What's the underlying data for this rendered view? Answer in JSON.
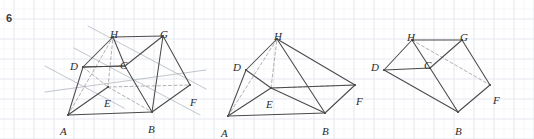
{
  "page": {
    "question_number": "6",
    "background": "#ffffff",
    "grid_color": "#e3e7ef",
    "grid_spacing_px": 20,
    "ink_color": "#4a4a4a",
    "guide_color": "#9aa0a8",
    "dash_color": "#8e8e8e",
    "width": 534,
    "height": 139
  },
  "figures": [
    {
      "id": "figure-1",
      "name": "prism-with-construction-lines",
      "vertices": {
        "A": {
          "x": 68,
          "y": 115
        },
        "B": {
          "x": 152,
          "y": 112
        },
        "C": {
          "x": 125,
          "y": 66
        },
        "D": {
          "x": 83,
          "y": 67
        },
        "E": {
          "x": 108,
          "y": 87
        },
        "F": {
          "x": 190,
          "y": 85
        },
        "G": {
          "x": 163,
          "y": 36
        },
        "H": {
          "x": 113,
          "y": 37
        }
      },
      "labels": [
        {
          "text": "A",
          "x": 60,
          "y": 126
        },
        {
          "text": "B",
          "x": 148,
          "y": 124
        },
        {
          "text": "C",
          "x": 120,
          "y": 60
        },
        {
          "text": "D",
          "x": 70,
          "y": 61
        },
        {
          "text": "E",
          "x": 104,
          "y": 98
        },
        {
          "text": "F",
          "x": 190,
          "y": 97
        },
        {
          "text": "G",
          "x": 160,
          "y": 29
        },
        {
          "text": "H",
          "x": 110,
          "y": 29
        }
      ],
      "solid_edges": [
        [
          "A",
          "B"
        ],
        [
          "A",
          "D"
        ],
        [
          "A",
          "E"
        ],
        [
          "B",
          "C"
        ],
        [
          "B",
          "F"
        ],
        [
          "B",
          "G"
        ],
        [
          "C",
          "D"
        ],
        [
          "C",
          "G"
        ],
        [
          "D",
          "H"
        ],
        [
          "D",
          "C"
        ],
        [
          "F",
          "G"
        ],
        [
          "G",
          "H"
        ],
        [
          "H",
          "C"
        ]
      ],
      "dashed_edges": [
        [
          "A",
          "H"
        ],
        [
          "E",
          "H"
        ],
        [
          "E",
          "F"
        ],
        [
          "D",
          "E"
        ],
        [
          "E",
          "B"
        ]
      ],
      "guide_lines": [
        {
          "x1": 45,
          "y1": 66,
          "x2": 124,
          "y2": 108
        },
        {
          "x1": 74,
          "y1": 48,
          "x2": 200,
          "y2": 115
        },
        {
          "x1": 88,
          "y1": 26,
          "x2": 206,
          "y2": 89
        },
        {
          "x1": 45,
          "y1": 92,
          "x2": 206,
          "y2": 70
        }
      ]
    },
    {
      "id": "figure-2",
      "name": "prism-clean-view",
      "vertices": {
        "A": {
          "x": 228,
          "y": 116
        },
        "B": {
          "x": 325,
          "y": 113
        },
        "D": {
          "x": 246,
          "y": 70
        },
        "E": {
          "x": 271,
          "y": 88
        },
        "F": {
          "x": 355,
          "y": 85
        },
        "H": {
          "x": 277,
          "y": 39
        }
      },
      "labels": [
        {
          "text": "A",
          "x": 221,
          "y": 128
        },
        {
          "text": "B",
          "x": 322,
          "y": 126
        },
        {
          "text": "D",
          "x": 233,
          "y": 62
        },
        {
          "text": "E",
          "x": 266,
          "y": 99
        },
        {
          "text": "F",
          "x": 356,
          "y": 96
        },
        {
          "text": "H",
          "x": 274,
          "y": 31
        }
      ],
      "solid_edges": [
        [
          "A",
          "B"
        ],
        [
          "A",
          "D"
        ],
        [
          "A",
          "E"
        ],
        [
          "B",
          "F"
        ],
        [
          "B",
          "E"
        ],
        [
          "D",
          "H"
        ],
        [
          "D",
          "E"
        ],
        [
          "H",
          "F"
        ],
        [
          "H",
          "B"
        ],
        [
          "E",
          "F"
        ]
      ],
      "dashed_edges": [
        [
          "A",
          "H"
        ],
        [
          "E",
          "H"
        ],
        [
          "E",
          "F"
        ]
      ],
      "guide_lines": []
    },
    {
      "id": "figure-3",
      "name": "prism-rotated-view",
      "vertices": {
        "B": {
          "x": 458,
          "y": 112
        },
        "C": {
          "x": 430,
          "y": 68
        },
        "D": {
          "x": 384,
          "y": 70
        },
        "F": {
          "x": 490,
          "y": 85
        },
        "G": {
          "x": 462,
          "y": 40
        },
        "H": {
          "x": 412,
          "y": 40
        }
      },
      "labels": [
        {
          "text": "B",
          "x": 455,
          "y": 126
        },
        {
          "text": "C",
          "x": 424,
          "y": 60
        },
        {
          "text": "D",
          "x": 371,
          "y": 62
        },
        {
          "text": "F",
          "x": 493,
          "y": 95
        },
        {
          "text": "G",
          "x": 460,
          "y": 32
        },
        {
          "text": "H",
          "x": 407,
          "y": 32
        }
      ],
      "solid_edges": [
        [
          "D",
          "H"
        ],
        [
          "D",
          "C"
        ],
        [
          "D",
          "B"
        ],
        [
          "H",
          "G"
        ],
        [
          "H",
          "C"
        ],
        [
          "G",
          "C"
        ],
        [
          "G",
          "F"
        ],
        [
          "C",
          "B"
        ],
        [
          "B",
          "F"
        ]
      ],
      "dashed_edges": [
        [
          "H",
          "F"
        ]
      ],
      "guide_lines": []
    }
  ]
}
